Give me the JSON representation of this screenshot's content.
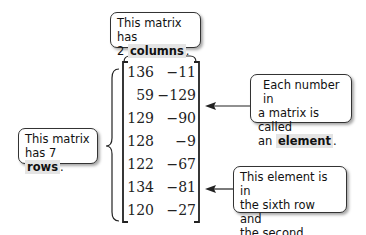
{
  "callouts": {
    "columns": {
      "pre": "This matrix has",
      "line2_pre": "2 ",
      "bold": "columns",
      "post": "."
    },
    "rows": {
      "line1": "This matrix",
      "line2_pre": "has 7 ",
      "bold": "rows",
      "post": "."
    },
    "element": {
      "line1": "Each number in",
      "line2": "a matrix is called",
      "line3_pre": "an ",
      "bold": "element",
      "post": "."
    },
    "position": {
      "line1": "This element is in",
      "line2": "the sixth row and",
      "line3": "the second column."
    }
  },
  "matrix": {
    "rows": [
      [
        "136",
        "−11"
      ],
      [
        "59",
        "−129"
      ],
      [
        "129",
        "−90"
      ],
      [
        "128",
        "−9"
      ],
      [
        "122",
        "−67"
      ],
      [
        "134",
        "−81"
      ],
      [
        "120",
        "−27"
      ]
    ]
  },
  "colors": {
    "highlight": "#e4e4e4",
    "border": "#333333"
  }
}
